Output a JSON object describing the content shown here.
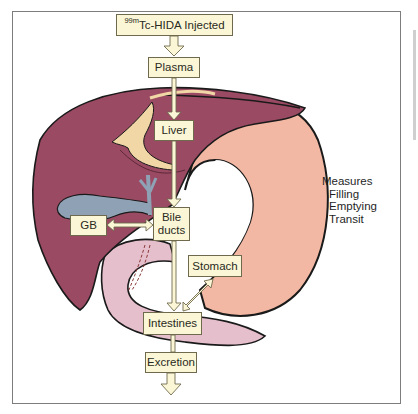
{
  "diagram": {
    "title_box": {
      "superscript": "99m",
      "label": "Tc-HIDA Injected"
    },
    "nodes": {
      "plasma": "Plasma",
      "liver": "Liver",
      "bile_ducts_line1": "Bile",
      "bile_ducts_line2": "ducts",
      "gb": "GB",
      "stomach": "Stomach",
      "intestines": "Intestines",
      "excretion": "Excretion"
    },
    "measures": {
      "heading": "Measures",
      "items": [
        "Filling",
        "Emptying",
        "Transit"
      ]
    },
    "flow": [
      {
        "from": "99mTc-HIDA Injected",
        "to": "Plasma",
        "direction": "one-way"
      },
      {
        "from": "Plasma",
        "to": "Liver",
        "direction": "one-way"
      },
      {
        "from": "Liver",
        "to": "Bile ducts",
        "direction": "one-way"
      },
      {
        "from": "Bile ducts",
        "to": "GB",
        "direction": "two-way"
      },
      {
        "from": "Bile ducts",
        "to": "Intestines",
        "direction": "one-way"
      },
      {
        "from": "Stomach",
        "to": "Intestines",
        "direction": "two-way"
      },
      {
        "from": "Intestines",
        "to": "Excretion",
        "direction": "one-way"
      },
      {
        "from": "Excretion",
        "to": "out",
        "direction": "one-way"
      }
    ],
    "colors": {
      "liver": "#9b4a63",
      "liver_dark": "#7d3a52",
      "stomach": "#f2b8a3",
      "intestine": "#e6bfcc",
      "gallbladder": "#8fa2b5",
      "ligament": "#f1d6a6",
      "box_fill": "#fbf7d6",
      "box_border": "#6f6a4e",
      "arrow_fill": "#fbf7d6"
    }
  }
}
